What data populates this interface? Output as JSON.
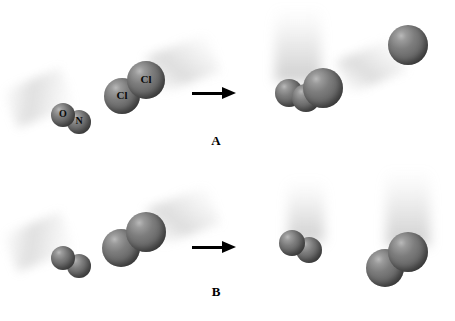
{
  "figure": {
    "type": "molecular-collision-diagram",
    "background_color": "#ffffff",
    "atom_color": "#6b6b6b",
    "highlight_color": "#b9b9b9",
    "arrow_color": "#000000",
    "label_color": "#000000"
  },
  "panels": [
    {
      "id": "A",
      "caption": "A",
      "caption_x": 204,
      "caption_y": 133,
      "outcome": "reactive-collision",
      "arrow": {
        "x": 192,
        "y": 86,
        "width": 44,
        "height": 14
      },
      "reactants": [
        {
          "name": "nitric-oxide",
          "formula": "NO",
          "atoms": [
            {
              "element": "O",
              "label": "O",
              "cx": 63,
              "cy": 115,
              "r": 12,
              "label_size": 10,
              "z": 2
            },
            {
              "element": "N",
              "label": "N",
              "cx": 79,
              "cy": 122,
              "r": 12,
              "label_size": 10,
              "z": 1
            }
          ],
          "trail": {
            "kind": "diag-ul",
            "x": 8,
            "y": 78,
            "width": 62,
            "height": 40,
            "rotate": -22
          }
        },
        {
          "name": "chlorine",
          "formula": "Cl2",
          "atoms": [
            {
              "element": "Cl",
              "label": "Cl",
              "cx": 146,
              "cy": 80,
              "r": 19,
              "label_size": 11,
              "z": 2
            },
            {
              "element": "Cl",
              "label": "Cl",
              "cx": 122,
              "cy": 96,
              "r": 18,
              "label_size": 11,
              "z": 1
            }
          ],
          "trail": {
            "kind": "diag-ur",
            "x": 150,
            "y": 44,
            "width": 66,
            "height": 40,
            "rotate": -20
          }
        }
      ],
      "products": [
        {
          "name": "nitrosyl-chloride",
          "formula": "NOCl",
          "atoms": [
            {
              "element": "O",
              "label": "",
              "cx": 289,
              "cy": 93,
              "r": 14,
              "label_size": 0,
              "z": 1
            },
            {
              "element": "N",
              "label": "",
              "cx": 306,
              "cy": 98,
              "r": 14,
              "label_size": 0,
              "z": 2
            },
            {
              "element": "Cl",
              "label": "",
              "cx": 323,
              "cy": 88,
              "r": 20,
              "label_size": 0,
              "z": 3
            }
          ],
          "trail": {
            "kind": "cone",
            "x": 275,
            "y": 8,
            "width": 46,
            "height": 74,
            "rotate": 0
          }
        },
        {
          "name": "chlorine-atom",
          "formula": "Cl",
          "atoms": [
            {
              "element": "Cl",
              "label": "",
              "cx": 408,
              "cy": 45,
              "r": 20,
              "label_size": 0,
              "z": 1
            }
          ],
          "trail": {
            "kind": "diag-ur",
            "x": 340,
            "y": 48,
            "width": 62,
            "height": 36,
            "rotate": -22
          }
        }
      ]
    },
    {
      "id": "B",
      "caption": "B",
      "caption_x": 204,
      "caption_y": 284,
      "outcome": "non-reactive-collision",
      "arrow": {
        "x": 192,
        "y": 240,
        "width": 44,
        "height": 14
      },
      "reactants": [
        {
          "name": "nitric-oxide",
          "formula": "NO",
          "atoms": [
            {
              "element": "O",
              "label": "",
              "cx": 63,
              "cy": 258,
              "r": 12,
              "label_size": 0,
              "z": 2
            },
            {
              "element": "N",
              "label": "",
              "cx": 79,
              "cy": 266,
              "r": 12,
              "label_size": 0,
              "z": 1
            }
          ],
          "trail": {
            "kind": "diag-ul",
            "x": 8,
            "y": 222,
            "width": 62,
            "height": 40,
            "rotate": -22
          }
        },
        {
          "name": "chlorine",
          "formula": "Cl2",
          "atoms": [
            {
              "element": "Cl",
              "label": "",
              "cx": 146,
              "cy": 232,
              "r": 20,
              "label_size": 0,
              "z": 2
            },
            {
              "element": "Cl",
              "label": "",
              "cx": 121,
              "cy": 248,
              "r": 19,
              "label_size": 0,
              "z": 1
            }
          ],
          "trail": {
            "kind": "diag-ur",
            "x": 150,
            "y": 196,
            "width": 66,
            "height": 40,
            "rotate": -20
          }
        }
      ],
      "products": [
        {
          "name": "nitric-oxide",
          "formula": "NO",
          "atoms": [
            {
              "element": "O",
              "label": "",
              "cx": 292,
              "cy": 243,
              "r": 13,
              "label_size": 0,
              "z": 2
            },
            {
              "element": "N",
              "label": "",
              "cx": 309,
              "cy": 250,
              "r": 13,
              "label_size": 0,
              "z": 1
            }
          ],
          "trail": {
            "kind": "cone",
            "x": 288,
            "y": 180,
            "width": 36,
            "height": 62,
            "rotate": 0
          }
        },
        {
          "name": "chlorine",
          "formula": "Cl2",
          "atoms": [
            {
              "element": "Cl",
              "label": "",
              "cx": 408,
              "cy": 252,
              "r": 20,
              "label_size": 0,
              "z": 2
            },
            {
              "element": "Cl",
              "label": "",
              "cx": 385,
              "cy": 268,
              "r": 19,
              "label_size": 0,
              "z": 1
            }
          ],
          "trail": {
            "kind": "cone",
            "x": 386,
            "y": 170,
            "width": 44,
            "height": 76,
            "rotate": 0
          }
        }
      ]
    }
  ]
}
